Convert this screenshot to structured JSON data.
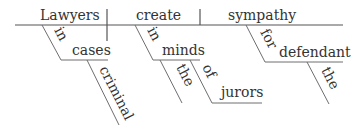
{
  "diagram": {
    "type": "sentence-diagram",
    "sentence": "Lawyers in criminal cases create sympathy in the minds of the jurors for the defendant",
    "subject": "Lawyers",
    "verb": "create",
    "object": "sympathy",
    "modifiers": {
      "subject_prep": "in",
      "subject_prep_object": "cases",
      "subject_prep_object_mod": "criminal",
      "verb_prep": "in",
      "verb_prep_object": "minds",
      "verb_prep_object_mod": "the",
      "nested_prep": "of",
      "nested_prep_object": "jurors",
      "object_prep": "for",
      "object_prep_object": "defendant",
      "object_prep_object_mod": "the"
    }
  }
}
